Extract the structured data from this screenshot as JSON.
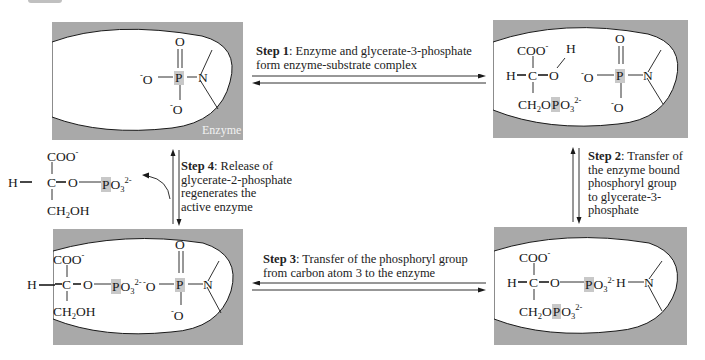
{
  "enzyme_label": "Enzyme",
  "steps": [
    {
      "id": 1,
      "label": "Step 1",
      "text": ": Enzyme and glycerate-3-phosphate",
      "text2": "form enzyme-substrate complex"
    },
    {
      "id": 2,
      "label": "Step 2",
      "text": ": Transfer of",
      "lines": [
        "the enzyme bound",
        "phosphoryl group",
        "to glycerate-3-",
        "phosphate"
      ]
    },
    {
      "id": 3,
      "label": "Step 3",
      "text": ": Transfer of the phosphoryl group",
      "text2": "from carbon atom 3 to the enzyme"
    },
    {
      "id": 4,
      "label": "Step 4",
      "text": ": Release of",
      "lines": [
        "glycerate-2-phosphate",
        "regenerates the",
        "active enzyme"
      ]
    }
  ],
  "molecules": {
    "coo": "COO",
    "neg": "-",
    "h": "H",
    "c": "C",
    "o": "O",
    "p": "P",
    "n": "N",
    "ch2oh": "CH",
    "oh": "OH",
    "ch2o": "CH",
    "po3": "PO",
    "sub2": "2",
    "sub3": "3",
    "charge2": "2-"
  },
  "colors": {
    "enzyme_gray": "#a9a9a9",
    "highlight": "#c8c8c8",
    "line": "#1a1a1a"
  }
}
